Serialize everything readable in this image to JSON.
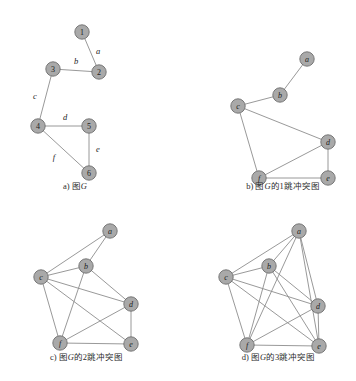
{
  "figure": {
    "top_bleed_text": "",
    "bottom_bleed_text": "",
    "node_fill": "#a9a9a9",
    "node_stroke": "#6e6e6e",
    "edge_color": "#8d8d8d"
  },
  "panels": [
    {
      "id": "panel-a",
      "caption_prefix": "a) ",
      "caption_text": "图",
      "caption_symbol": "G",
      "caption_suffix": "",
      "caption_full": "a) 图G",
      "nodes": [
        {
          "id": "1",
          "label": "1",
          "x": 62,
          "y": 14,
          "style": "num"
        },
        {
          "id": "2",
          "label": "2",
          "x": 79,
          "y": 54,
          "style": "num"
        },
        {
          "id": "3",
          "label": "3",
          "x": 33,
          "y": 51,
          "style": "num"
        },
        {
          "id": "4",
          "label": "4",
          "x": 18,
          "y": 108,
          "style": "num"
        },
        {
          "id": "5",
          "label": "5",
          "x": 69,
          "y": 108,
          "style": "num"
        },
        {
          "id": "6",
          "label": "6",
          "x": 69,
          "y": 155,
          "style": "num"
        }
      ],
      "edges": [
        {
          "from": "1",
          "to": "2",
          "label": "a",
          "lx": 78,
          "ly": 33
        },
        {
          "from": "3",
          "to": "2",
          "label": "b",
          "lx": 56,
          "ly": 43
        },
        {
          "from": "3",
          "to": "4",
          "label": "c",
          "lx": 15,
          "ly": 78
        },
        {
          "from": "4",
          "to": "5",
          "label": "d",
          "lx": 45,
          "ly": 99
        },
        {
          "from": "5",
          "to": "6",
          "label": "e",
          "lx": 78,
          "ly": 131
        },
        {
          "from": "4",
          "to": "6",
          "label": "f",
          "lx": 34,
          "ly": 139
        }
      ]
    },
    {
      "id": "panel-b",
      "caption_prefix": "b) ",
      "caption_text": "图",
      "caption_symbol": "G",
      "caption_suffix": "的1跳冲突图",
      "caption_full": "b) 图G的1跳冲突图",
      "nodes": [
        {
          "id": "a",
          "label": "a",
          "x": 85,
          "y": 9,
          "style": "alpha"
        },
        {
          "id": "b",
          "label": "b",
          "x": 58,
          "y": 45,
          "style": "alpha"
        },
        {
          "id": "c",
          "label": "c",
          "x": 16,
          "y": 56,
          "style": "alpha"
        },
        {
          "id": "d",
          "label": "d",
          "x": 106,
          "y": 92,
          "style": "alpha"
        },
        {
          "id": "e",
          "label": "e",
          "x": 106,
          "y": 128,
          "style": "alpha"
        },
        {
          "id": "f",
          "label": "f",
          "x": 37,
          "y": 128,
          "style": "alpha"
        }
      ],
      "edges": [
        {
          "from": "a",
          "to": "b"
        },
        {
          "from": "b",
          "to": "c"
        },
        {
          "from": "c",
          "to": "d"
        },
        {
          "from": "c",
          "to": "f"
        },
        {
          "from": "d",
          "to": "f"
        },
        {
          "from": "d",
          "to": "e"
        },
        {
          "from": "e",
          "to": "f"
        }
      ]
    },
    {
      "id": "panel-c",
      "caption_prefix": "c) ",
      "caption_text": "图",
      "caption_symbol": "G",
      "caption_suffix": "的2跳冲突图",
      "caption_full": "c) 图G的2跳冲突图",
      "nodes": [
        {
          "id": "a",
          "label": "a",
          "x": 80,
          "y": 10,
          "style": "alpha"
        },
        {
          "id": "b",
          "label": "b",
          "x": 56,
          "y": 45,
          "style": "alpha"
        },
        {
          "id": "c",
          "label": "c",
          "x": 11,
          "y": 56,
          "style": "alpha"
        },
        {
          "id": "d",
          "label": "d",
          "x": 101,
          "y": 83,
          "style": "alpha"
        },
        {
          "id": "e",
          "label": "e",
          "x": 101,
          "y": 123,
          "style": "alpha"
        },
        {
          "id": "f",
          "label": "f",
          "x": 30,
          "y": 122,
          "style": "alpha"
        }
      ],
      "edges": [
        {
          "from": "a",
          "to": "b"
        },
        {
          "from": "a",
          "to": "c"
        },
        {
          "from": "b",
          "to": "c"
        },
        {
          "from": "b",
          "to": "d"
        },
        {
          "from": "b",
          "to": "f"
        },
        {
          "from": "c",
          "to": "d"
        },
        {
          "from": "c",
          "to": "e"
        },
        {
          "from": "c",
          "to": "f"
        },
        {
          "from": "d",
          "to": "e"
        },
        {
          "from": "d",
          "to": "f"
        },
        {
          "from": "e",
          "to": "f"
        }
      ]
    },
    {
      "id": "panel-d",
      "caption_prefix": "d) ",
      "caption_text": "图",
      "caption_symbol": "G",
      "caption_suffix": "的3跳冲突图",
      "caption_full": "d) 图G的3跳冲突图",
      "nodes": [
        {
          "id": "a",
          "label": "a",
          "x": 87,
          "y": 10,
          "style": "alpha"
        },
        {
          "id": "b",
          "label": "b",
          "x": 57,
          "y": 45,
          "style": "alpha"
        },
        {
          "id": "c",
          "label": "c",
          "x": 14,
          "y": 56,
          "style": "alpha"
        },
        {
          "id": "d",
          "label": "d",
          "x": 106,
          "y": 85,
          "style": "alpha"
        },
        {
          "id": "e",
          "label": "e",
          "x": 107,
          "y": 125,
          "style": "alpha"
        },
        {
          "id": "f",
          "label": "f",
          "x": 35,
          "y": 124,
          "style": "alpha"
        }
      ],
      "edges": [
        {
          "from": "a",
          "to": "b"
        },
        {
          "from": "a",
          "to": "c"
        },
        {
          "from": "a",
          "to": "d"
        },
        {
          "from": "a",
          "to": "e"
        },
        {
          "from": "a",
          "to": "f"
        },
        {
          "from": "b",
          "to": "c"
        },
        {
          "from": "b",
          "to": "d"
        },
        {
          "from": "b",
          "to": "e"
        },
        {
          "from": "b",
          "to": "f"
        },
        {
          "from": "c",
          "to": "d"
        },
        {
          "from": "c",
          "to": "e"
        },
        {
          "from": "c",
          "to": "f"
        },
        {
          "from": "d",
          "to": "e"
        },
        {
          "from": "d",
          "to": "f"
        },
        {
          "from": "e",
          "to": "f"
        }
      ]
    }
  ]
}
